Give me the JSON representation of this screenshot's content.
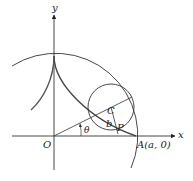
{
  "diagram": {
    "type": "hypocycloid (astroid) construction",
    "axes": {
      "x_label": "x",
      "y_label": "y",
      "origin_label": "O"
    },
    "points": {
      "center_label": "C",
      "point_label": "P",
      "a_point_label": "A(a, 0)"
    },
    "labels": {
      "radius_label": "b",
      "angle_label": "θ"
    },
    "colors": {
      "line": "#333333",
      "curve": "#555555",
      "background": "#ffffff"
    }
  }
}
